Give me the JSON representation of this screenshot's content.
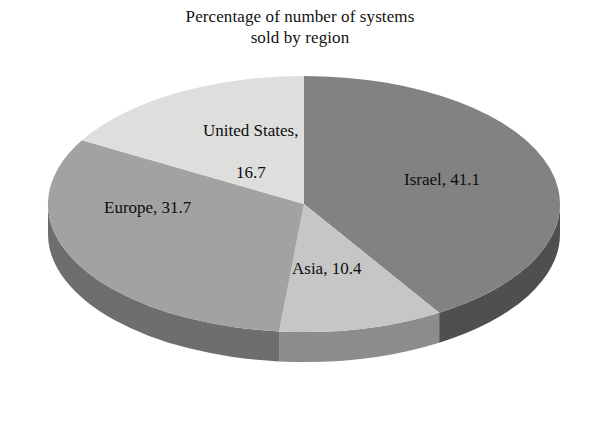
{
  "chart_data": {
    "type": "pie",
    "title": "Percentage of number of systems sold by region",
    "title_lines": [
      "Percentage of number of systems",
      "sold by region"
    ],
    "xlabel": "",
    "ylabel": "",
    "unit": "percent",
    "legend": "none",
    "grid": false,
    "three_d": true,
    "start_angle_deg": 0,
    "direction": "clockwise",
    "categories": [
      "Israel",
      "Asia",
      "Europe",
      "United States"
    ],
    "values": [
      41.1,
      10.4,
      31.7,
      16.7
    ],
    "total": 99.9,
    "slices": [
      {
        "name": "Israel",
        "value": 41.1,
        "label": "Israel, 41.1",
        "color": "#828282",
        "side_color": "#4f4f4f",
        "start_deg": 0.0,
        "end_deg": 148.0
      },
      {
        "name": "Asia",
        "value": 10.4,
        "label": "Asia, 10.4",
        "color": "#c6c6c6",
        "side_color": "#8c8c8c",
        "start_deg": 148.0,
        "end_deg": 185.5
      },
      {
        "name": "Europe",
        "value": 31.7,
        "label": "Europe, 31.7",
        "color": "#a2a2a2",
        "side_color": "#6e6e6e",
        "start_deg": 185.5,
        "end_deg": 299.7
      },
      {
        "name": "United States",
        "value": 16.7,
        "label": "United States, 16.7",
        "color": "#dededc",
        "side_color": "#a8a8a6",
        "start_deg": 299.7,
        "end_deg": 360.0
      }
    ]
  },
  "labels": {
    "united_states": {
      "line1": "United States,",
      "line2": "16.7"
    },
    "israel": {
      "text": "Israel, 41.1"
    },
    "europe": {
      "text": "Europe, 31.7"
    },
    "asia": {
      "text": "Asia, 10.4"
    }
  },
  "colors": {
    "background": "#ffffff",
    "text": "#0d0d0d",
    "israel": "#828282",
    "asia": "#c6c6c6",
    "europe": "#a2a2a2",
    "united_states": "#dededc"
  }
}
